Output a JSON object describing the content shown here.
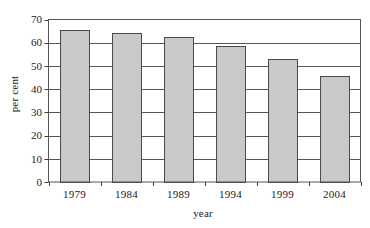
{
  "chart_data": {
    "type": "bar",
    "title": "",
    "xlabel": "year",
    "ylabel": "per cent",
    "categories": [
      "1979",
      "1984",
      "1989",
      "1994",
      "1999",
      "2004"
    ],
    "values": [
      65.5,
      64,
      62.5,
      58.5,
      53,
      45.5
    ],
    "ylim": [
      0,
      70
    ],
    "ytick_labels": [
      "0",
      "10",
      "20",
      "30",
      "40",
      "50",
      "60",
      "70"
    ],
    "ytick_values": [
      0,
      10,
      20,
      30,
      40,
      50,
      60,
      70
    ],
    "grid": "horizontal",
    "legend": "none",
    "bar_fill": "#c9c9c9",
    "bar_edge": "#4a4a4a",
    "axis_color": "#3a3a3a",
    "grid_color": "#555555",
    "text_color": "#1a1a1a",
    "background": "#ffffff"
  }
}
